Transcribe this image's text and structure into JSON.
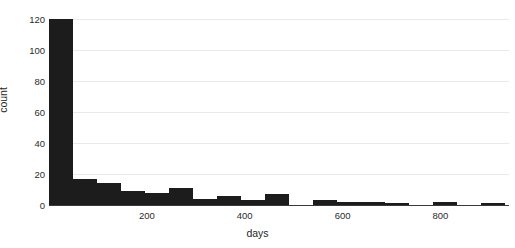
{
  "chart_data": {
    "type": "bar",
    "title": "",
    "subtitle": "",
    "xlabel": "days",
    "ylabel": "count",
    "xlim": [
      0,
      940
    ],
    "ylim": [
      0,
      124
    ],
    "grid": true,
    "legend": null,
    "bar_color": "#1c1c1c",
    "grid_color": "#e9e9e9",
    "axis_color": "#3a3a3a",
    "bin_width": 24,
    "xticks": [
      200,
      400,
      600,
      800
    ],
    "xtick_labels": [
      "200",
      "400",
      "600",
      "800"
    ],
    "yticks": [
      0,
      20,
      40,
      60,
      80,
      100,
      120
    ],
    "ytick_labels": [
      "0",
      "20",
      "40",
      "60",
      "80",
      "100",
      "120"
    ],
    "bins": [
      {
        "x0": 0,
        "x1": 49,
        "value": 120
      },
      {
        "x0": 49,
        "x1": 98,
        "value": 17
      },
      {
        "x0": 98,
        "x1": 147,
        "value": 14
      },
      {
        "x0": 147,
        "x1": 196,
        "value": 9
      },
      {
        "x0": 196,
        "x1": 245,
        "value": 8
      },
      {
        "x0": 245,
        "x1": 294,
        "value": 11
      },
      {
        "x0": 294,
        "x1": 343,
        "value": 4
      },
      {
        "x0": 343,
        "x1": 392,
        "value": 6
      },
      {
        "x0": 392,
        "x1": 441,
        "value": 3
      },
      {
        "x0": 441,
        "x1": 490,
        "value": 7
      },
      {
        "x0": 490,
        "x1": 539,
        "value": 0
      },
      {
        "x0": 539,
        "x1": 588,
        "value": 3
      },
      {
        "x0": 588,
        "x1": 637,
        "value": 2
      },
      {
        "x0": 637,
        "x1": 686,
        "value": 2
      },
      {
        "x0": 686,
        "x1": 735,
        "value": 1
      },
      {
        "x0": 735,
        "x1": 784,
        "value": 0
      },
      {
        "x0": 784,
        "x1": 833,
        "value": 2
      },
      {
        "x0": 833,
        "x1": 882,
        "value": 0
      },
      {
        "x0": 882,
        "x1": 931,
        "value": 1
      }
    ]
  }
}
